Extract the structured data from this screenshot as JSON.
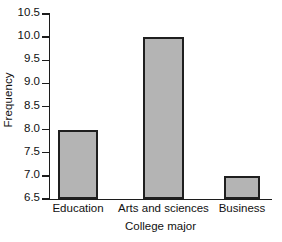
{
  "chart_data": {
    "type": "bar",
    "title": "",
    "subtitle": "",
    "categories": [
      "Education",
      "Arts and sciences",
      "Business"
    ],
    "values": [
      8.0,
      10.0,
      7.0
    ],
    "xlabel": "College major",
    "ylabel": "Frequency",
    "ylim": [
      6.5,
      10.5
    ],
    "ytick_labels": [
      "10.5",
      "10.0",
      "9.5",
      "9.0",
      "8.5",
      "8.0",
      "7.5",
      "7.0",
      "6.5"
    ],
    "ytick_values": [
      10.5,
      10.0,
      9.5,
      9.0,
      8.5,
      8.0,
      7.5,
      7.0,
      6.5
    ],
    "ytick_step": 0.5,
    "grid": false,
    "legend": null,
    "annotations": [],
    "colors": {
      "bar_fill": "#b4b4b4",
      "bar_edge": "#1f1f1f",
      "axis": "#1c1c1c",
      "text": "#111111",
      "background": "#ffffff"
    },
    "bars": [
      {
        "category": "Education",
        "value": 8.0,
        "left_px": 58,
        "width_px": 40
      },
      {
        "category": "Arts and sciences",
        "value": 10.0,
        "left_px": 143,
        "width_px": 41
      },
      {
        "category": "Business",
        "value": 7.0,
        "left_px": 224,
        "width_px": 36
      }
    ]
  }
}
